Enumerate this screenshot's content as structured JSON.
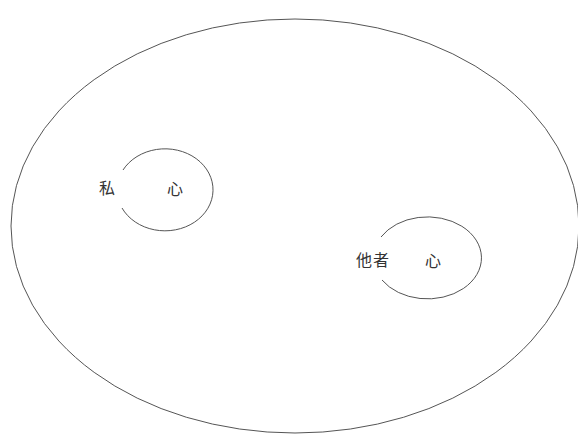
{
  "diagram": {
    "outer": {
      "name": "world"
    },
    "nodes": [
      {
        "id": "self",
        "label": "私",
        "inner_label": "心"
      },
      {
        "id": "other",
        "label": "他者",
        "inner_label": "心"
      }
    ]
  },
  "colors": {
    "stroke": "#555555",
    "text": "#333333",
    "background": "#ffffff"
  }
}
